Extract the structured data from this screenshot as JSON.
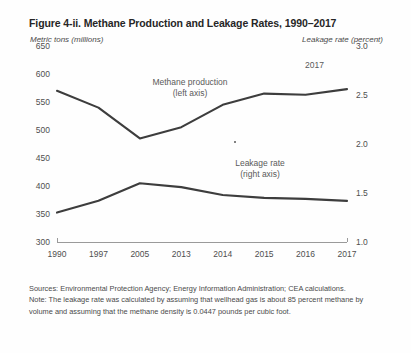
{
  "figure": {
    "title": "Figure 4-ii. Methane Production and Leakage Rates, 1990–2017",
    "left_axis_title": "Metric tons (millions)",
    "right_axis_title": "Leakage rate (percent)",
    "corner_label": "2017"
  },
  "annotations": {
    "production_label_line1": "Methane production",
    "production_label_line2": "(left axis)",
    "leakage_label_line1": "Leakage rate",
    "leakage_label_line2": "(right axis)"
  },
  "footnotes": {
    "sources": "Sources: Environmental Protection Agency; Energy Information Administration; CEA calculations.",
    "note": "Note: The leakage rate was calculated by assuming that wellhead gas is about 85 percent methane by volume and assuming that the methane density is 0.0447 pounds per cubic foot."
  },
  "colors": {
    "line": "#3d3d3d",
    "axis": "#9a9a9a",
    "text": "#4a4a4a",
    "title": "#262626"
  },
  "chart_data": {
    "type": "line",
    "title": "Figure 4-ii. Methane Production and Leakage Rates, 1990–2017",
    "xlabel": "",
    "ylabel": "Metric tons (millions)",
    "y2label": "Leakage rate (percent)",
    "categories": [
      "1990",
      "1997",
      "2005",
      "2013",
      "2014",
      "2015",
      "2016",
      "2017"
    ],
    "ylim": [
      300,
      650
    ],
    "yticks": [
      300,
      350,
      400,
      450,
      500,
      550,
      600,
      650
    ],
    "y2lim": [
      1.0,
      3.0
    ],
    "y2ticks": [
      1.0,
      1.5,
      2.0,
      2.5,
      3.0
    ],
    "grid": false,
    "legend": "in-plot annotations",
    "series": [
      {
        "name": "Methane production (left axis)",
        "axis": "left",
        "values": [
          570,
          540,
          485,
          505,
          545,
          565,
          563,
          573
        ]
      },
      {
        "name": "Leakage rate (right axis)",
        "axis": "right",
        "values": [
          1.3,
          1.42,
          1.6,
          1.56,
          1.48,
          1.45,
          1.44,
          1.42
        ]
      }
    ]
  }
}
